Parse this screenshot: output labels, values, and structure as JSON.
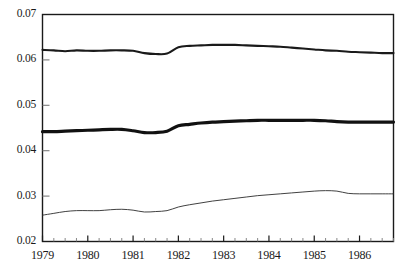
{
  "chart_data": {
    "type": "line",
    "title": "",
    "subtitle": "",
    "xlabel": "",
    "ylabel": "",
    "xlim": [
      1979.0,
      1986.75
    ],
    "ylim": [
      0.02,
      0.07
    ],
    "grid": false,
    "legend_position": "none",
    "y_ticks": [
      0.02,
      0.03,
      0.04,
      0.05,
      0.06,
      0.07
    ],
    "y_tick_labels": [
      "0.02",
      "0.03",
      "0.04",
      "0.05",
      "0.06",
      "0.07"
    ],
    "x_ticks": [
      1979,
      1980,
      1981,
      1982,
      1983,
      1984,
      1985,
      1986
    ],
    "x_tick_labels": [
      "1979",
      "1980",
      "1981",
      "1982",
      "1983",
      "1984",
      "1985",
      "1986"
    ],
    "x_minor_tick_interval": 0.25,
    "x": [
      1979.0,
      1979.25,
      1979.5,
      1979.75,
      1980.0,
      1980.25,
      1980.5,
      1980.75,
      1981.0,
      1981.25,
      1981.5,
      1981.75,
      1982.0,
      1982.25,
      1982.5,
      1982.75,
      1983.0,
      1983.25,
      1983.5,
      1983.75,
      1984.0,
      1984.25,
      1984.5,
      1984.75,
      1985.0,
      1985.25,
      1985.5,
      1985.75,
      1986.0,
      1986.25,
      1986.5,
      1986.75
    ],
    "series": [
      {
        "name": "upper-line",
        "line_width": 2.1,
        "color": "#1a1a1a",
        "values": [
          0.0622,
          0.0621,
          0.0619,
          0.0621,
          0.062,
          0.062,
          0.0621,
          0.0621,
          0.062,
          0.0615,
          0.0613,
          0.0614,
          0.0628,
          0.0631,
          0.0632,
          0.0633,
          0.0633,
          0.0633,
          0.0632,
          0.0631,
          0.063,
          0.0629,
          0.0627,
          0.0625,
          0.0623,
          0.0621,
          0.062,
          0.0618,
          0.0617,
          0.0616,
          0.0615,
          0.0615
        ]
      },
      {
        "name": "middle-line",
        "line_width": 3.2,
        "color": "#111111",
        "values": [
          0.0442,
          0.0442,
          0.0443,
          0.0444,
          0.0445,
          0.0446,
          0.0447,
          0.0447,
          0.0444,
          0.044,
          0.044,
          0.0443,
          0.0455,
          0.0458,
          0.0461,
          0.0463,
          0.0464,
          0.0465,
          0.0466,
          0.0467,
          0.0467,
          0.0467,
          0.0467,
          0.0467,
          0.0467,
          0.0466,
          0.0464,
          0.0463,
          0.0463,
          0.0463,
          0.0463,
          0.0463
        ]
      },
      {
        "name": "lower-line",
        "line_width": 0.9,
        "color": "#2b2b2b",
        "values": [
          0.0258,
          0.0262,
          0.0266,
          0.0268,
          0.0268,
          0.0268,
          0.027,
          0.0271,
          0.0269,
          0.0265,
          0.0266,
          0.0268,
          0.0276,
          0.0281,
          0.0285,
          0.0289,
          0.0292,
          0.0295,
          0.0298,
          0.0301,
          0.0303,
          0.0305,
          0.0307,
          0.0309,
          0.0311,
          0.0312,
          0.0311,
          0.0306,
          0.0305,
          0.0305,
          0.0305,
          0.0305
        ]
      }
    ]
  },
  "axes": {
    "frame_color": "#1a1a1a",
    "tick_color": "#1a1a1a",
    "minor_tick_color": "#7a7a7a"
  }
}
